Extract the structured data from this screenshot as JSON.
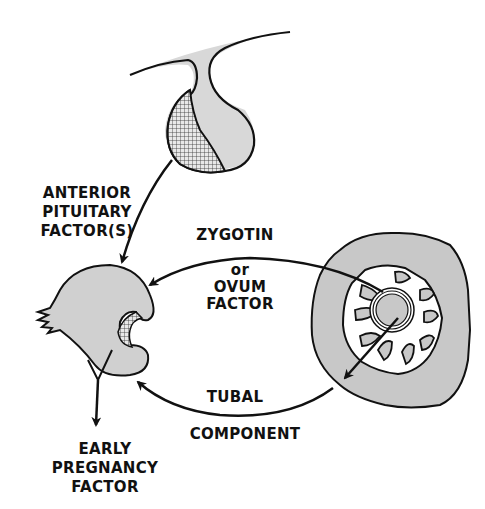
{
  "diagram": {
    "type": "biological-flow",
    "colors": {
      "stroke": "#111111",
      "fill_gray": "#cfcfcf",
      "fill_dark": "#bdbdbd",
      "background": "#ffffff"
    },
    "nodes": [
      {
        "id": "pituitary",
        "shape": "pituitary-gland"
      },
      {
        "id": "ovary",
        "shape": "ovary-with-corpus-luteum"
      },
      {
        "id": "oviduct",
        "shape": "oviduct-cross-section-with-ovum"
      }
    ],
    "labels": {
      "anterior_pituitary": [
        "ANTERIOR",
        "PITUITARY",
        "FACTOR(S)"
      ],
      "zygotin_line1": "ZYGOTIN",
      "zygotin_or": "or",
      "zygotin_line3": "OVUM",
      "zygotin_line4": "FACTOR",
      "tubal_line1": "TUBAL",
      "tubal_line2": "COMPONENT",
      "epf": [
        "EARLY",
        "PREGNANCY",
        "FACTOR"
      ]
    },
    "edges": [
      {
        "from": "pituitary",
        "to": "ovary",
        "label": "ANTERIOR PITUITARY FACTOR(S)"
      },
      {
        "from": "oviduct",
        "to": "ovary",
        "label": "ZYGOTIN or OVUM FACTOR"
      },
      {
        "from": "oviduct",
        "to": "ovary",
        "label": "TUBAL COMPONENT"
      },
      {
        "from": "ovary",
        "to": "output",
        "label": "EARLY PREGNANCY FACTOR"
      }
    ]
  }
}
